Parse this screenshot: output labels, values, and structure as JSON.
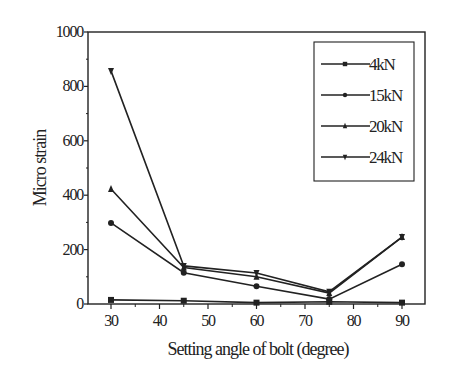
{
  "chart_data": {
    "type": "line",
    "title": "",
    "xlabel": "Setting angle of bolt (degree)",
    "ylabel": "Micro strain",
    "x": [
      30,
      45,
      60,
      75,
      90
    ],
    "xticks": [
      30,
      40,
      50,
      60,
      70,
      80,
      90
    ],
    "yticks": [
      0,
      200,
      400,
      600,
      800,
      1000
    ],
    "xlim": [
      25,
      95
    ],
    "ylim": [
      0,
      1000
    ],
    "grid": false,
    "legend_position": "upper right",
    "series": [
      {
        "name": "4kN",
        "marker": "square",
        "values": [
          15,
          12,
          5,
          8,
          5
        ]
      },
      {
        "name": "15kN",
        "marker": "circle",
        "values": [
          298,
          115,
          65,
          18,
          146
        ]
      },
      {
        "name": "20kN",
        "marker": "triangle-up",
        "values": [
          423,
          134,
          100,
          40,
          246
        ]
      },
      {
        "name": "24kN",
        "marker": "triangle-down",
        "values": [
          857,
          140,
          114,
          45,
          246
        ]
      }
    ]
  }
}
